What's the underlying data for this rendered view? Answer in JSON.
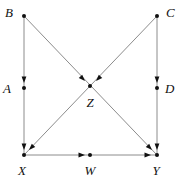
{
  "figure": {
    "type": "directed-geometric-diagram",
    "background_color": "#ffffff",
    "line_color": "#8c8c8c",
    "marker_color": "#111111",
    "label_color": "#111111",
    "width": 184,
    "height": 183
  },
  "vertices": [
    {
      "id": "B",
      "label": "B",
      "x": 24,
      "y": 16,
      "label_x": 13,
      "label_y": 14,
      "role": "corner-top-left"
    },
    {
      "id": "C",
      "label": "C",
      "x": 157,
      "y": 16,
      "label_x": 166,
      "label_y": 14,
      "role": "corner-top-right"
    },
    {
      "id": "A",
      "label": "A",
      "x": 24,
      "y": 88,
      "label_x": 11,
      "label_y": 90,
      "role": "midpoint-left"
    },
    {
      "id": "D",
      "label": "D",
      "x": 157,
      "y": 88,
      "label_x": 165,
      "label_y": 90,
      "role": "midpoint-right"
    },
    {
      "id": "Z",
      "label": "Z",
      "x": 90,
      "y": 86,
      "label_x": 90,
      "label_y": 104,
      "role": "intersection-center"
    },
    {
      "id": "X",
      "label": "X",
      "x": 24,
      "y": 155,
      "label_x": 22,
      "label_y": 172,
      "role": "corner-bottom-left"
    },
    {
      "id": "W",
      "label": "W",
      "x": 90,
      "y": 155,
      "label_x": 90,
      "label_y": 172,
      "role": "midpoint-bottom"
    },
    {
      "id": "Y",
      "label": "Y",
      "x": 157,
      "y": 155,
      "label_x": 156,
      "label_y": 172,
      "role": "corner-bottom-right"
    }
  ],
  "edges": [
    {
      "id": "B-A-X",
      "from": "B",
      "to": "X",
      "through": "A",
      "x1": 24,
      "y1": 16,
      "x2": 24,
      "y2": 155,
      "orientation": "vertical-left"
    },
    {
      "id": "C-D-Y",
      "from": "C",
      "to": "Y",
      "through": "D",
      "x1": 157,
      "y1": 16,
      "x2": 157,
      "y2": 155,
      "orientation": "vertical-right"
    },
    {
      "id": "X-W-Y",
      "from": "X",
      "to": "Y",
      "through": "W",
      "x1": 24,
      "y1": 155,
      "x2": 157,
      "y2": 155,
      "orientation": "horizontal-bottom"
    },
    {
      "id": "B-Z-Y",
      "from": "B",
      "to": "Y",
      "through": "Z",
      "x1": 24,
      "y1": 16,
      "x2": 157,
      "y2": 155,
      "orientation": "diagonal-down-right"
    },
    {
      "id": "C-Z-X",
      "from": "C",
      "to": "X",
      "through": "Z",
      "x1": 157,
      "y1": 16,
      "x2": 24,
      "y2": 155,
      "orientation": "diagonal-down-left"
    }
  ],
  "arrowheads": [
    {
      "id": "arrow-into-A",
      "x": 24,
      "y": 83,
      "angle": 90,
      "target": "A"
    },
    {
      "id": "arrow-into-D",
      "x": 157,
      "y": 83,
      "angle": 90,
      "target": "D"
    },
    {
      "id": "arrow-into-W",
      "x": 85,
      "y": 155,
      "angle": 0,
      "target": "W"
    },
    {
      "id": "arrow-into-Z-from-B",
      "x": 85,
      "y": 81,
      "angle": 46,
      "target": "Z"
    },
    {
      "id": "arrow-into-Z-from-C",
      "x": 96,
      "y": 81,
      "angle": 134,
      "target": "Z"
    },
    {
      "id": "arrow-into-X-vertical",
      "x": 24,
      "y": 150,
      "angle": 90,
      "target": "X"
    },
    {
      "id": "arrow-into-X-diagonal",
      "x": 29,
      "y": 150,
      "angle": 134,
      "target": "X"
    },
    {
      "id": "arrow-into-Y-vertical",
      "x": 157,
      "y": 150,
      "angle": 90,
      "target": "Y"
    },
    {
      "id": "arrow-into-Y-diagonal",
      "x": 152,
      "y": 150,
      "angle": 46,
      "target": "Y"
    },
    {
      "id": "arrow-into-Y-horizontal",
      "x": 151,
      "y": 155,
      "angle": 0,
      "target": "Y"
    }
  ]
}
